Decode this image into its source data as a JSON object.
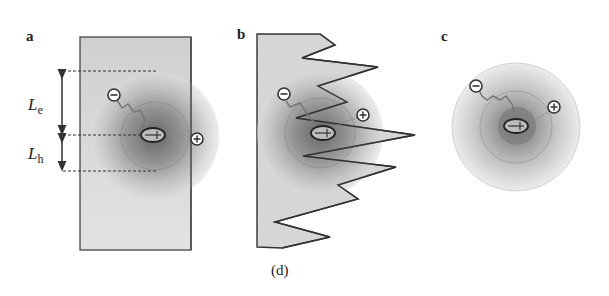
{
  "figure": {
    "caption": "(d)",
    "panels": [
      {
        "id": "a",
        "label": "a",
        "description": "Exciton near a flat interface (rectangular slab)"
      },
      {
        "id": "b",
        "label": "b",
        "description": "Exciton near a jagged / rough interface"
      },
      {
        "id": "c",
        "label": "c",
        "description": "Isolated exciton in free space"
      }
    ],
    "annotations": {
      "electron_length_main": "L",
      "electron_length_sub": "e",
      "hole_length_main": "L",
      "hole_length_sub": "h"
    },
    "particles": {
      "electron_symbol": "−",
      "hole_symbol": "+",
      "dipole_symbols": "−+"
    },
    "colors": {
      "slab_fill": "#d9d9d9",
      "outline": "#444444",
      "cloud_dark": "#7a7a7a",
      "cloud_light": "#e6e6e6"
    }
  }
}
